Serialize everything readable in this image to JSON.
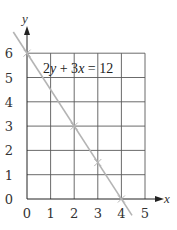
{
  "chart_data": {
    "type": "line",
    "title": "",
    "xlabel": "x",
    "ylabel": "y",
    "xlim": [
      0,
      5
    ],
    "ylim": [
      0,
      6
    ],
    "grid": true,
    "x_ticks": [
      "0",
      "1",
      "2",
      "3",
      "4",
      "5"
    ],
    "y_ticks": [
      "0",
      "1",
      "2",
      "3",
      "4",
      "5",
      "6"
    ],
    "series": [
      {
        "name": "2y + 3x = 12",
        "equation": "2y + 3x = 12",
        "x": [
          0,
          2,
          3,
          4
        ],
        "y": [
          6,
          3,
          1.5,
          0
        ],
        "marked_points": [
          [
            0,
            6
          ],
          [
            2,
            3
          ],
          [
            3,
            1.5
          ],
          [
            4,
            0
          ]
        ],
        "color": "#b4b4b4"
      }
    ],
    "annotations": [
      {
        "text": "2y + 3x = 12",
        "position": [
          0.8,
          5.4
        ]
      }
    ]
  },
  "labels": {
    "x_axis": "x",
    "y_axis": "y",
    "equation_parts": [
      "2",
      "y",
      " + 3",
      "x",
      " = 12"
    ]
  },
  "colors": {
    "grid": "#5a5a5a",
    "line": "#b4b4b4",
    "text": "#333333"
  }
}
